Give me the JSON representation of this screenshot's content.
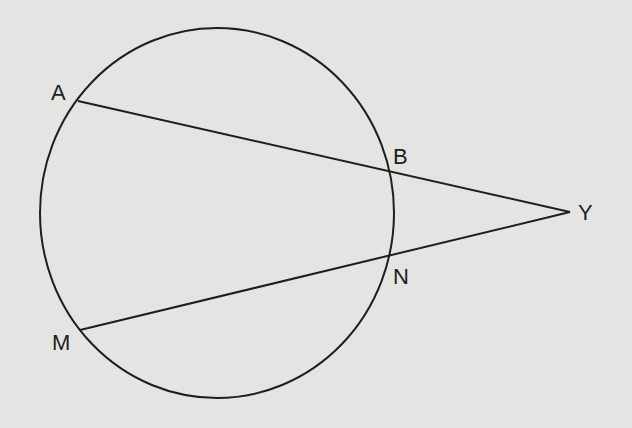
{
  "diagram": {
    "type": "geometry-secants",
    "background": "#e4e4e2",
    "stroke": "#1e1e1e",
    "circle": {
      "cx": 217,
      "cy": 213,
      "rx": 177,
      "ry": 185
    },
    "points": {
      "A": {
        "label": "A",
        "x": 78,
        "y": 101,
        "lx": 51,
        "ly": 100
      },
      "B": {
        "label": "B",
        "x": 390,
        "y": 171,
        "lx": 393,
        "ly": 164
      },
      "N": {
        "label": "N",
        "x": 390,
        "y": 257,
        "lx": 393,
        "ly": 284
      },
      "M": {
        "label": "M",
        "x": 80,
        "y": 330,
        "lx": 52,
        "ly": 350
      },
      "Y": {
        "label": "Y",
        "x": 570,
        "y": 212,
        "lx": 578,
        "ly": 220
      }
    },
    "segments": [
      {
        "from": "A",
        "to": "Y"
      },
      {
        "from": "M",
        "to": "Y"
      }
    ]
  }
}
